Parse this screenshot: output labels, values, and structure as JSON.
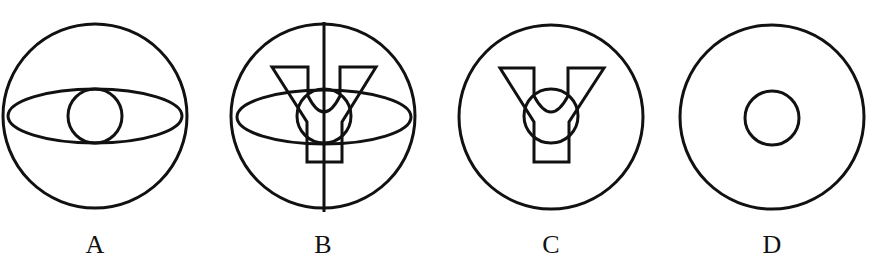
{
  "figures": [
    {
      "label": "A",
      "description": "circle containing horizontal ellipse with small centered circle"
    },
    {
      "label": "B",
      "description": "circle with vertical diameter, horizontal ellipse, small circle and Y-shaped outline"
    },
    {
      "label": "C",
      "description": "circle containing small circle and Y-shaped outline"
    },
    {
      "label": "D",
      "description": "circle containing small centered circle"
    }
  ],
  "colors": {
    "stroke": "#111111",
    "background": "#ffffff"
  }
}
